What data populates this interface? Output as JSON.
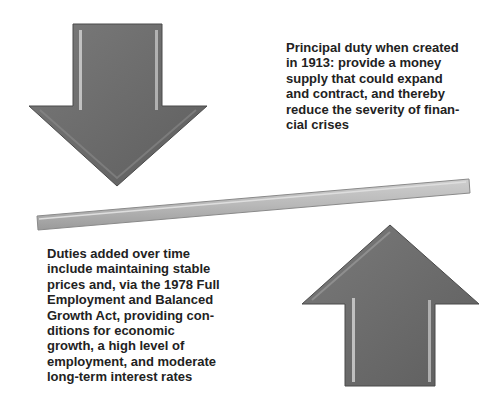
{
  "colors": {
    "arrow_fill": "#6c6c6c",
    "arrow_edge": "#4a4a4a",
    "bevel_light": "#cfcfcf",
    "bar_fill": "#b9b9b9",
    "text": "#222222",
    "background": "#ffffff"
  },
  "diagram": {
    "down_arrow": {
      "icon": "down-arrow-icon"
    },
    "up_arrow": {
      "icon": "up-arrow-icon"
    },
    "balance_bar": {
      "icon": "tilted-bar"
    }
  },
  "top_text": {
    "lines": [
      "Principal duty when created",
      "in 1913: provide a money",
      "supply that could expand",
      "and contract, and thereby",
      "reduce the severity of finan-",
      "cial crises"
    ]
  },
  "bottom_text": {
    "lines": [
      "Duties added over time",
      "include maintaining stable",
      "prices and, via the 1978 Full",
      "Employment and Balanced",
      "Growth Act, providing con-",
      "ditions for economic",
      "growth, a high level of",
      "employment, and moderate",
      "long-term interest rates"
    ]
  }
}
